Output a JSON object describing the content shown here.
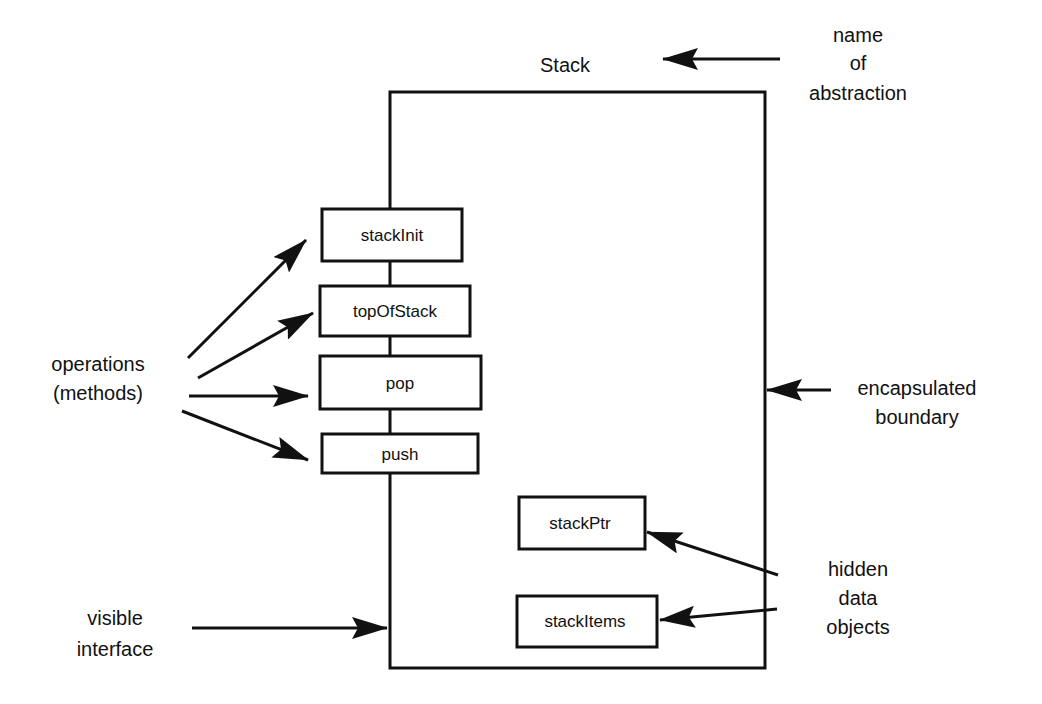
{
  "diagram": {
    "title": "Stack",
    "boundary_box": {
      "x": 390,
      "y": 92,
      "width": 375,
      "height": 576
    },
    "operations": [
      {
        "label": "stackInit",
        "x": 322,
        "y": 209,
        "width": 140,
        "height": 52
      },
      {
        "label": "topOfStack",
        "x": 320,
        "y": 286,
        "width": 150,
        "height": 50
      },
      {
        "label": "pop",
        "x": 320,
        "y": 356,
        "width": 161,
        "height": 53
      },
      {
        "label": "push",
        "x": 322,
        "y": 434,
        "width": 156,
        "height": 39
      }
    ],
    "data_objects": [
      {
        "label": "stackPtr",
        "x": 519,
        "y": 497,
        "width": 126,
        "height": 52
      },
      {
        "label": "stackItems",
        "x": 517,
        "y": 596,
        "width": 140,
        "height": 51
      }
    ],
    "annotations": {
      "name_of_abstraction": [
        "name",
        "of",
        "abstraction"
      ],
      "operations_methods": [
        "operations",
        "(methods)"
      ],
      "encapsulated_boundary": [
        "encapsulated",
        "boundary"
      ],
      "hidden_data_objects": [
        "hidden",
        "data",
        "objects"
      ],
      "visible_interface": [
        "visible",
        "interface"
      ]
    },
    "colors": {
      "stroke": "#111111",
      "background": "#ffffff"
    }
  }
}
